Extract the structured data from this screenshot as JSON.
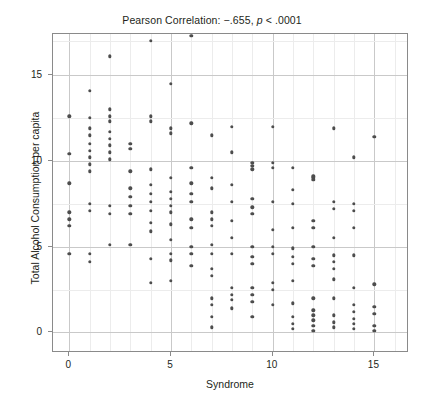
{
  "chart_data": {
    "type": "scatter",
    "title_prefix": "Pearson Correlation: −.655, ",
    "title_italic": "p",
    "title_suffix": " < .0001",
    "xlabel": "Syndrome",
    "ylabel": "Total Alcohol Consumption per capita",
    "xlim": [
      -0.8,
      16.7
    ],
    "ylim": [
      -1.2,
      17.4
    ],
    "xticks": [
      0,
      5,
      10,
      15
    ],
    "yticks": [
      0,
      5,
      10,
      15
    ],
    "xtick_labels": [
      "0",
      "5",
      "10",
      "15"
    ],
    "ytick_labels": [
      "0",
      "5",
      "10",
      "15"
    ],
    "grid": true,
    "legend": false,
    "marker_color": "#4d4d4d",
    "frame_color": "#8a8a8a",
    "grid_color": "#c9c9c9",
    "correlation": -0.655,
    "p_value": "< .0001",
    "points": [
      [
        0,
        12.6
      ],
      [
        0,
        10.4
      ],
      [
        0,
        8.7
      ],
      [
        0,
        7.0
      ],
      [
        0,
        6.6
      ],
      [
        0,
        6.2
      ],
      [
        0,
        4.6
      ],
      [
        1,
        14.1
      ],
      [
        1,
        12.5
      ],
      [
        1,
        11.9
      ],
      [
        1,
        11.5
      ],
      [
        1,
        11.0
      ],
      [
        1,
        10.6
      ],
      [
        1,
        10.2
      ],
      [
        1,
        9.8
      ],
      [
        1,
        9.4
      ],
      [
        1,
        7.5
      ],
      [
        1,
        7.1
      ],
      [
        1,
        4.6
      ],
      [
        1,
        4.1
      ],
      [
        2,
        16.1
      ],
      [
        2,
        13.0
      ],
      [
        2,
        12.6
      ],
      [
        2,
        12.3
      ],
      [
        2,
        11.7
      ],
      [
        2,
        11.3
      ],
      [
        2,
        10.9
      ],
      [
        2,
        10.5
      ],
      [
        2,
        10.1
      ],
      [
        2,
        7.4
      ],
      [
        2,
        6.9
      ],
      [
        2,
        5.1
      ],
      [
        3,
        11.0
      ],
      [
        3,
        10.7
      ],
      [
        3,
        9.4
      ],
      [
        3,
        8.4
      ],
      [
        3,
        7.9
      ],
      [
        3,
        7.4
      ],
      [
        3,
        6.9
      ],
      [
        3,
        5.1
      ],
      [
        4,
        17.0
      ],
      [
        4,
        12.6
      ],
      [
        4,
        12.3
      ],
      [
        4,
        9.5
      ],
      [
        4,
        8.6
      ],
      [
        4,
        8.1
      ],
      [
        4,
        7.6
      ],
      [
        4,
        7.1
      ],
      [
        4,
        6.4
      ],
      [
        4,
        5.9
      ],
      [
        4,
        4.3
      ],
      [
        4,
        2.9
      ],
      [
        5,
        14.5
      ],
      [
        5,
        11.9
      ],
      [
        5,
        11.6
      ],
      [
        5,
        9.0
      ],
      [
        5,
        8.2
      ],
      [
        5,
        7.8
      ],
      [
        5,
        7.4
      ],
      [
        5,
        7.0
      ],
      [
        5,
        6.3
      ],
      [
        5,
        5.4
      ],
      [
        5,
        4.6
      ],
      [
        5,
        4.2
      ],
      [
        5,
        3.0
      ],
      [
        6,
        17.3
      ],
      [
        6,
        12.2
      ],
      [
        6,
        9.6
      ],
      [
        6,
        8.7
      ],
      [
        6,
        8.1
      ],
      [
        6,
        7.6
      ],
      [
        6,
        6.6
      ],
      [
        6,
        6.1
      ],
      [
        6,
        5.0
      ],
      [
        6,
        4.6
      ],
      [
        6,
        3.9
      ],
      [
        7,
        11.5
      ],
      [
        7,
        9.0
      ],
      [
        7,
        8.4
      ],
      [
        7,
        7.0
      ],
      [
        7,
        6.6
      ],
      [
        7,
        6.2
      ],
      [
        7,
        5.1
      ],
      [
        7,
        4.6
      ],
      [
        7,
        3.7
      ],
      [
        7,
        3.3
      ],
      [
        7,
        2.0
      ],
      [
        7,
        1.6
      ],
      [
        7,
        0.9
      ],
      [
        7,
        0.3
      ],
      [
        8,
        12.0
      ],
      [
        8,
        10.5
      ],
      [
        8,
        8.6
      ],
      [
        8,
        7.6
      ],
      [
        8,
        6.5
      ],
      [
        8,
        5.5
      ],
      [
        8,
        4.6
      ],
      [
        8,
        2.6
      ],
      [
        8,
        2.2
      ],
      [
        8,
        1.9
      ],
      [
        8,
        1.4
      ],
      [
        9,
        9.9
      ],
      [
        9,
        9.7
      ],
      [
        9,
        9.5
      ],
      [
        9,
        7.8
      ],
      [
        9,
        7.3
      ],
      [
        9,
        6.9
      ],
      [
        9,
        5.0
      ],
      [
        9,
        4.4
      ],
      [
        9,
        4.0
      ],
      [
        9,
        2.6
      ],
      [
        9,
        2.2
      ],
      [
        9,
        1.8
      ],
      [
        9,
        0.9
      ],
      [
        10,
        12.0
      ],
      [
        10,
        9.9
      ],
      [
        10,
        9.6
      ],
      [
        10,
        7.6
      ],
      [
        10,
        6.0
      ],
      [
        10,
        5.0
      ],
      [
        10,
        4.6
      ],
      [
        10,
        2.9
      ],
      [
        10,
        2.5
      ],
      [
        10,
        1.6
      ],
      [
        11,
        9.6
      ],
      [
        11,
        8.3
      ],
      [
        11,
        7.5
      ],
      [
        11,
        6.1
      ],
      [
        11,
        4.9
      ],
      [
        11,
        4.4
      ],
      [
        11,
        4.0
      ],
      [
        11,
        3.0
      ],
      [
        11,
        1.7
      ],
      [
        11,
        0.9
      ],
      [
        11,
        0.5
      ],
      [
        11,
        0.2
      ],
      [
        12,
        9.1
      ],
      [
        12,
        9.0
      ],
      [
        12,
        8.9
      ],
      [
        12,
        6.5
      ],
      [
        12,
        6.1
      ],
      [
        12,
        5.0
      ],
      [
        12,
        4.3
      ],
      [
        12,
        3.9
      ],
      [
        12,
        2.0
      ],
      [
        12,
        1.3
      ],
      [
        12,
        1.0
      ],
      [
        12,
        0.7
      ],
      [
        12,
        0.4
      ],
      [
        12,
        0.1
      ],
      [
        13,
        11.9
      ],
      [
        13,
        7.6
      ],
      [
        13,
        7.2
      ],
      [
        13,
        5.5
      ],
      [
        13,
        4.5
      ],
      [
        13,
        4.1
      ],
      [
        13,
        3.7
      ],
      [
        13,
        3.1
      ],
      [
        13,
        2.0
      ],
      [
        13,
        1.0
      ],
      [
        13,
        0.6
      ],
      [
        13,
        0.3
      ],
      [
        14,
        10.2
      ],
      [
        14,
        7.5
      ],
      [
        14,
        7.1
      ],
      [
        14,
        6.1
      ],
      [
        14,
        4.5
      ],
      [
        14,
        2.6
      ],
      [
        14,
        1.6
      ],
      [
        14,
        1.2
      ],
      [
        14,
        0.8
      ],
      [
        14,
        0.5
      ],
      [
        14,
        0.2
      ],
      [
        15,
        11.4
      ],
      [
        15,
        2.8
      ],
      [
        15,
        1.5
      ],
      [
        15,
        1.1
      ],
      [
        15,
        0.4
      ],
      [
        15,
        0.1
      ]
    ]
  }
}
